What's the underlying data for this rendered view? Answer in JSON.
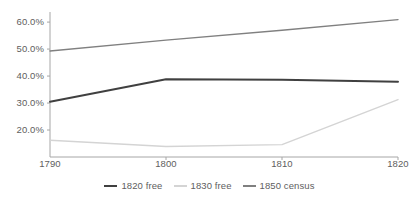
{
  "chart_data": {
    "type": "line",
    "title": "",
    "xlabel": "",
    "ylabel": "",
    "x": [
      1790,
      1800,
      1810,
      1820
    ],
    "xticklabels": [
      "1790",
      "1800",
      "1810",
      "1820"
    ],
    "yticklabels": [
      "20.0%",
      "30.0%",
      "40.0%",
      "50.0%",
      "60.0%"
    ],
    "yticks": [
      20,
      30,
      40,
      50,
      60
    ],
    "ylim": [
      10.0,
      63.0
    ],
    "xlim": [
      1790,
      1820
    ],
    "grid": false,
    "legend_position": "bottom",
    "series": [
      {
        "name": "1820 free",
        "color": "#404040",
        "values": [
          30.5,
          38.8,
          38.6,
          37.9
        ]
      },
      {
        "name": "1830 free",
        "color": "#d4d4d4",
        "values": [
          16.2,
          13.9,
          14.6,
          31.3
        ]
      },
      {
        "name": "1850 census",
        "color": "#808080",
        "values": [
          49.3,
          53.3,
          57.0,
          60.9
        ]
      }
    ]
  },
  "axis": {
    "line_color": "#a6a6a6",
    "tick_color": "#a6a6a6"
  },
  "legend": {
    "entries": [
      {
        "label": "1820 free",
        "color": "#404040"
      },
      {
        "label": "1830 free",
        "color": "#d4d4d4"
      },
      {
        "label": "1850 census",
        "color": "#808080"
      }
    ]
  }
}
